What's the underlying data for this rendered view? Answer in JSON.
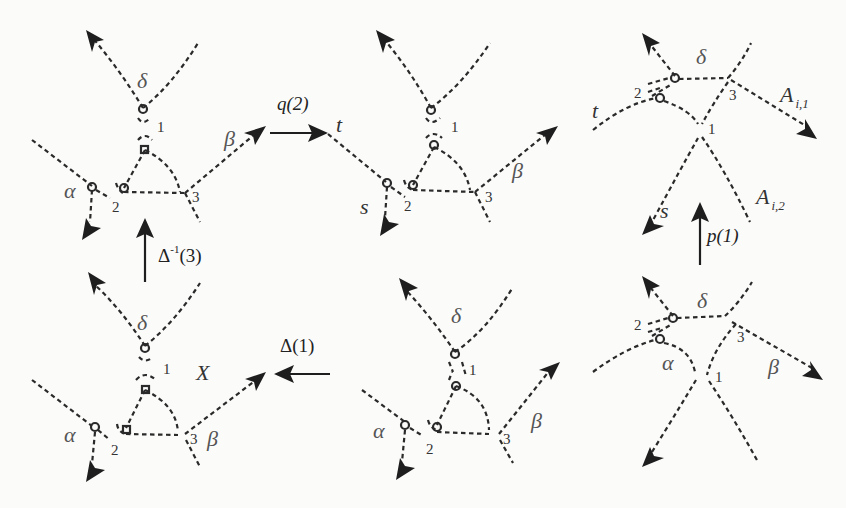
{
  "figure": {
    "background": "#fbfbfa",
    "ink": "#1e1e1e"
  },
  "operations": {
    "q2": "q(2)",
    "delta_inv_3_base": "Δ",
    "delta_inv_3_sup": "-1",
    "delta_inv_3_arg": "(3)",
    "delta_1": "Δ(1)",
    "p1": "p(1)"
  },
  "graphs": {
    "top_left": {
      "delta": "δ",
      "alpha": "α",
      "beta": "β",
      "n1": "1",
      "n2": "2",
      "n3": "3"
    },
    "top_middle": {
      "t": "t",
      "s": "s",
      "beta": "β",
      "n1": "1",
      "n2": "2",
      "n3": "3"
    },
    "top_right": {
      "delta": "δ",
      "t": "t",
      "s": "s",
      "A1_base": "A",
      "A1_sub": "i,1",
      "A2_base": "A",
      "A2_sub": "i,2",
      "n1": "1",
      "n2": "2",
      "n3": "3"
    },
    "bottom_left": {
      "delta": "δ",
      "alpha": "α",
      "beta": "β",
      "X": "X",
      "n1": "1",
      "n2": "2",
      "n3": "3"
    },
    "bottom_middle": {
      "delta": "δ",
      "alpha": "α",
      "beta": "β",
      "n1": "1",
      "n2": "2",
      "n3": "3"
    },
    "bottom_right": {
      "delta": "δ",
      "alpha": "α",
      "beta": "β",
      "n1": "1",
      "n2": "2",
      "n3": "3"
    }
  }
}
